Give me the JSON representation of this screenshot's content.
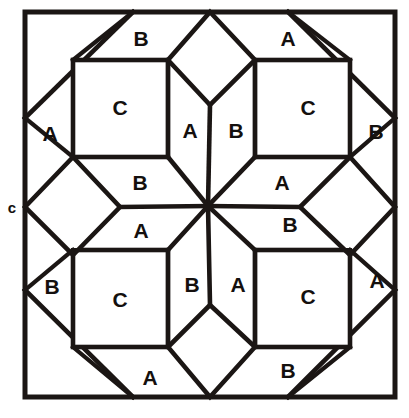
{
  "figure": {
    "kind": "quilt-block-piecing-diagram",
    "canvas": {
      "width": 409,
      "height": 418
    },
    "background_color": "#ffffff",
    "line_color": "#1b1614",
    "fill_color": "#ffffff"
  },
  "frame": {
    "label": "outer-block-border",
    "x": 25,
    "y": 12,
    "width": 370,
    "height": 385
  },
  "center_point": {
    "x": 208,
    "y": 206
  },
  "patch_labels": [
    {
      "id": "tl-b-top",
      "text": "B",
      "x": 141,
      "y": 38
    },
    {
      "id": "tr-a-top",
      "text": "A",
      "x": 288,
      "y": 38
    },
    {
      "id": "tl-c",
      "text": "C",
      "x": 120,
      "y": 107
    },
    {
      "id": "tr-c",
      "text": "C",
      "x": 308,
      "y": 107
    },
    {
      "id": "tl-a-left",
      "text": "A",
      "x": 50,
      "y": 133
    },
    {
      "id": "tl-a-inner",
      "text": "A",
      "x": 190,
      "y": 130
    },
    {
      "id": "tr-b-inner",
      "text": "B",
      "x": 236,
      "y": 130
    },
    {
      "id": "tr-b-right",
      "text": "B",
      "x": 376,
      "y": 131
    },
    {
      "id": "tl-b-bottom",
      "text": "B",
      "x": 140,
      "y": 182
    },
    {
      "id": "tr-a-bottom",
      "text": "A",
      "x": 282,
      "y": 182
    },
    {
      "id": "bl-a-top",
      "text": "A",
      "x": 141,
      "y": 230
    },
    {
      "id": "br-b-top",
      "text": "B",
      "x": 290,
      "y": 224
    },
    {
      "id": "bl-b-left",
      "text": "B",
      "x": 52,
      "y": 286
    },
    {
      "id": "bl-c",
      "text": "C",
      "x": 120,
      "y": 299
    },
    {
      "id": "br-c",
      "text": "C",
      "x": 308,
      "y": 296
    },
    {
      "id": "bl-b-inner",
      "text": "B",
      "x": 192,
      "y": 284
    },
    {
      "id": "br-a-inner",
      "text": "A",
      "x": 238,
      "y": 284
    },
    {
      "id": "br-a-right",
      "text": "A",
      "x": 377,
      "y": 280
    },
    {
      "id": "bl-a-bottom",
      "text": "A",
      "x": 150,
      "y": 377
    },
    {
      "id": "br-b-bottom",
      "text": "B",
      "x": 288,
      "y": 370
    }
  ],
  "edge_labels": [
    {
      "id": "left-edge-c",
      "text": "c",
      "x": 12,
      "y": 207
    }
  ],
  "geometry_notes": {
    "corner_squares": [
      {
        "id": "tl-c-square",
        "x": 73,
        "y": 60,
        "w": 95,
        "h": 97
      },
      {
        "id": "tr-c-square",
        "x": 255,
        "y": 60,
        "w": 95,
        "h": 97
      },
      {
        "id": "bl-c-square",
        "x": 73,
        "y": 250,
        "w": 95,
        "h": 97
      },
      {
        "id": "br-c-square",
        "x": 255,
        "y": 250,
        "w": 95,
        "h": 97
      }
    ],
    "edge_diamonds": [
      {
        "id": "top-diamond",
        "apex": [
          210,
          12
        ],
        "left": [
          168,
          60
        ],
        "right": [
          255,
          60
        ],
        "inner": [
          210,
          105
        ]
      },
      {
        "id": "left-diamond",
        "apex": [
          25,
          207
        ],
        "top": [
          73,
          157
        ],
        "bottom": [
          73,
          255
        ],
        "inner": [
          120,
          207
        ]
      },
      {
        "id": "right-diamond",
        "apex": [
          395,
          207
        ],
        "top": [
          350,
          157
        ],
        "bottom": [
          350,
          255
        ],
        "inner": [
          300,
          207
        ]
      },
      {
        "id": "bottom-diamond",
        "apex": [
          210,
          397
        ],
        "left": [
          168,
          347
        ],
        "right": [
          255,
          347
        ],
        "inner": [
          210,
          305
        ]
      }
    ],
    "corner_triangles": [
      "top-left",
      "top-right",
      "bottom-left",
      "bottom-right"
    ],
    "center_spokes": 8
  }
}
